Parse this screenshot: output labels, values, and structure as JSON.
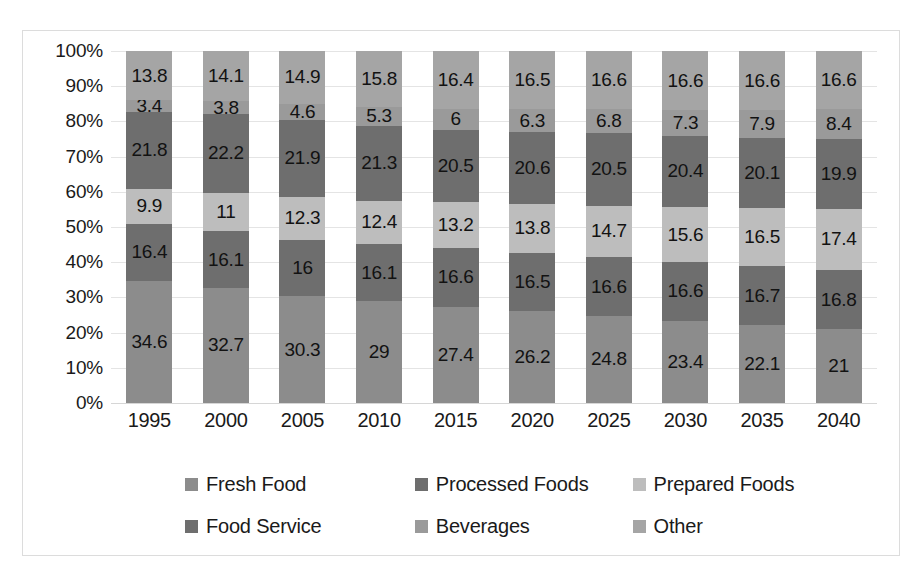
{
  "chart_data": {
    "type": "bar",
    "subtype": "stacked-100-percent",
    "title": "",
    "subtitle": "",
    "xlabel": "",
    "ylabel": "",
    "categories": [
      "1995",
      "2000",
      "2005",
      "2010",
      "2015",
      "2020",
      "2025",
      "2030",
      "2035",
      "2040"
    ],
    "ylim": [
      0,
      100
    ],
    "ytick_labels": [
      "0%",
      "10%",
      "20%",
      "30%",
      "40%",
      "50%",
      "60%",
      "70%",
      "80%",
      "90%",
      "100%"
    ],
    "ytick_values": [
      0,
      10,
      20,
      30,
      40,
      50,
      60,
      70,
      80,
      90,
      100
    ],
    "grid": true,
    "legend_position": "bottom",
    "stack_order_bottom_to_top": [
      "Fresh Food",
      "Processed Foods",
      "Prepared Foods",
      "Food Service",
      "Beverages",
      "Other"
    ],
    "series": [
      {
        "name": "Fresh Food",
        "color": "#8c8c8c",
        "values": [
          34.6,
          32.7,
          30.3,
          29,
          27.4,
          26.2,
          24.8,
          23.4,
          22.1,
          21
        ],
        "labels": [
          "34.6",
          "32.7",
          "30.3",
          "29",
          "27.4",
          "26.2",
          "24.8",
          "23.4",
          "22.1",
          "21"
        ]
      },
      {
        "name": "Processed Foods",
        "color": "#6e6e6e",
        "values": [
          16.4,
          16.1,
          16,
          16.1,
          16.6,
          16.5,
          16.6,
          16.6,
          16.7,
          16.8
        ],
        "labels": [
          "16.4",
          "16.1",
          "16",
          "16.1",
          "16.6",
          "16.5",
          "16.6",
          "16.6",
          "16.7",
          "16.8"
        ]
      },
      {
        "name": "Prepared Foods",
        "color": "#bdbdbd",
        "values": [
          9.9,
          11,
          12.3,
          12.4,
          13.2,
          13.8,
          14.7,
          15.6,
          16.5,
          17.4
        ],
        "labels": [
          "9.9",
          "11",
          "12.3",
          "12.4",
          "13.2",
          "13.8",
          "14.7",
          "15.6",
          "16.5",
          "17.4"
        ]
      },
      {
        "name": "Food Service",
        "color": "#6e6e6e",
        "values": [
          21.8,
          22.2,
          21.9,
          21.3,
          20.5,
          20.6,
          20.5,
          20.4,
          20.1,
          19.9
        ],
        "labels": [
          "21.8",
          "22.2",
          "21.9",
          "21.3",
          "20.5",
          "20.6",
          "20.5",
          "20.4",
          "20.1",
          "19.9"
        ]
      },
      {
        "name": "Beverages",
        "color": "#9a9a9a",
        "values": [
          3.4,
          3.8,
          4.6,
          5.3,
          6,
          6.3,
          6.8,
          7.3,
          7.9,
          8.4
        ],
        "labels": [
          "3.4",
          "3.8",
          "4.6",
          "5.3",
          "6",
          "6.3",
          "6.8",
          "7.3",
          "7.9",
          "8.4"
        ]
      },
      {
        "name": "Other",
        "color": "#a5a5a5",
        "values": [
          13.8,
          14.1,
          14.9,
          15.8,
          16.4,
          16.5,
          16.6,
          16.6,
          16.6,
          16.6
        ],
        "labels": [
          "13.8",
          "14.1",
          "14.9",
          "15.8",
          "16.4",
          "16.5",
          "16.6",
          "16.6",
          "16.6",
          "16.6"
        ]
      }
    ]
  },
  "legend": {
    "rows": [
      [
        {
          "label": "Fresh Food",
          "color": "#8c8c8c"
        },
        {
          "label": "Processed Foods",
          "color": "#6e6e6e"
        },
        {
          "label": "Prepared Foods",
          "color": "#bdbdbd"
        }
      ],
      [
        {
          "label": "Food Service",
          "color": "#6e6e6e"
        },
        {
          "label": "Beverages",
          "color": "#9a9a9a"
        },
        {
          "label": "Other",
          "color": "#a5a5a5"
        }
      ]
    ]
  },
  "colors": {
    "plot_background": "#ffffff",
    "frame_border": "#dcdcdc",
    "gridline": "#e4e4e4",
    "text": "#1a1a1a"
  }
}
